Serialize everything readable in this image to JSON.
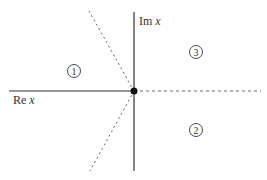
{
  "diagram": {
    "type": "complex-plane",
    "axes": {
      "real_label": "Re x",
      "imag_label": "Im x",
      "real_label_parts": {
        "prefix": "Re ",
        "var": "x"
      },
      "imag_label_parts": {
        "prefix": "Im ",
        "var": "x"
      }
    },
    "origin_point": {
      "x": 134,
      "y": 91
    },
    "regions": [
      {
        "id": 1,
        "label": "1",
        "cx": 74,
        "cy": 71
      },
      {
        "id": 2,
        "label": "2",
        "cx": 196,
        "cy": 130
      },
      {
        "id": 3,
        "label": "3",
        "cx": 196,
        "cy": 52
      }
    ],
    "lines": {
      "real_axis": {
        "x1": 9,
        "y1": 91,
        "x2": 134,
        "y2": 91,
        "style": "solid"
      },
      "imag_axis": {
        "x1": 134,
        "y1": 12,
        "x2": 134,
        "y2": 171,
        "style": "solid"
      },
      "dashed_right": {
        "x1": 134,
        "y1": 91,
        "x2": 261,
        "y2": 91,
        "style": "dashed"
      },
      "dashed_upper": {
        "x1": 134,
        "y1": 91,
        "x2": 89,
        "y2": 11,
        "style": "dashed"
      },
      "dashed_lower": {
        "x1": 134,
        "y1": 91,
        "x2": 90,
        "y2": 171,
        "style": "dashed"
      }
    },
    "colors": {
      "line": "#333333",
      "dashed": "#666666",
      "point": "#111111"
    }
  }
}
